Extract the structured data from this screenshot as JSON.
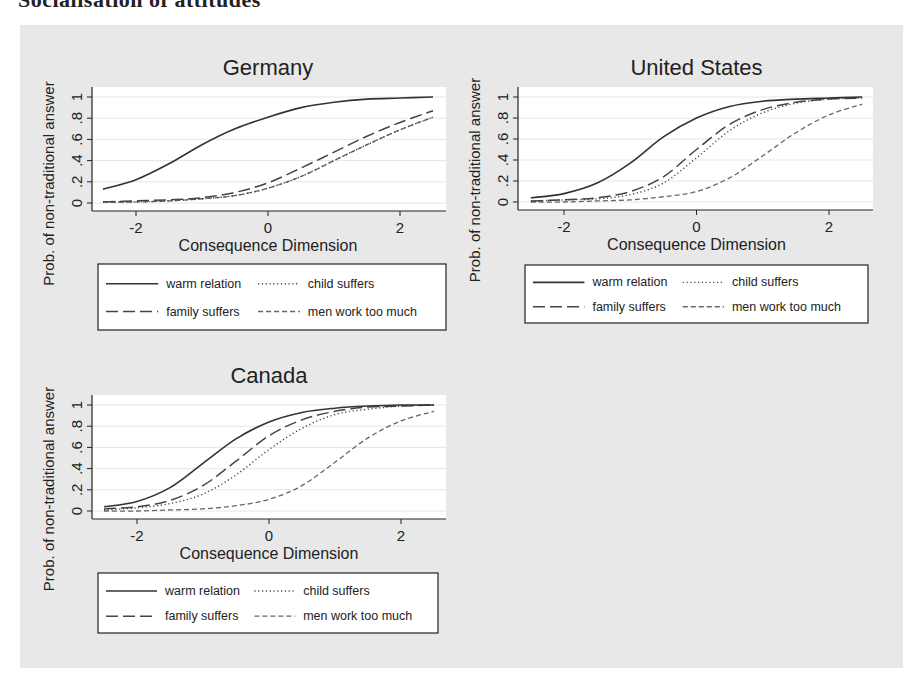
{
  "page": {
    "cut_heading": "Socialisation of attitudes",
    "background_color": "#e8e8e8"
  },
  "chart_data": [
    {
      "type": "line",
      "title": "Germany",
      "xlabel": "Consequence Dimension",
      "ylabel": "Prob. of non-traditional answer",
      "xlim": [
        -2.5,
        2.5
      ],
      "ylim": [
        0,
        1
      ],
      "xticks": [
        -2,
        0,
        2
      ],
      "yticks": [
        0,
        0.2,
        0.4,
        0.6,
        0.8,
        1
      ],
      "ytick_labels": [
        "0",
        ".2",
        ".4",
        ".6",
        ".8",
        "1"
      ],
      "grid": true,
      "legend_position": "bottom",
      "x": [
        -2.5,
        -2,
        -1.5,
        -1,
        -0.5,
        0,
        0.5,
        1,
        1.5,
        2,
        2.5
      ],
      "series": [
        {
          "name": "warm relation",
          "style": "solid",
          "values": [
            0.13,
            0.22,
            0.37,
            0.55,
            0.7,
            0.81,
            0.9,
            0.95,
            0.98,
            0.99,
            1.0
          ]
        },
        {
          "name": "child suffers",
          "style": "dotted",
          "values": [
            0.01,
            0.01,
            0.02,
            0.04,
            0.07,
            0.14,
            0.25,
            0.4,
            0.55,
            0.69,
            0.81
          ]
        },
        {
          "name": "family suffers",
          "style": "longdash",
          "values": [
            0.01,
            0.02,
            0.03,
            0.05,
            0.1,
            0.19,
            0.33,
            0.48,
            0.63,
            0.76,
            0.87
          ]
        },
        {
          "name": "men work too much",
          "style": "shortdash",
          "values": [
            0.01,
            0.01,
            0.02,
            0.04,
            0.07,
            0.14,
            0.25,
            0.4,
            0.55,
            0.69,
            0.81
          ]
        }
      ]
    },
    {
      "type": "line",
      "title": "United States",
      "xlabel": "Consequence Dimension",
      "ylabel": "Prob. of non-traditional answer",
      "xlim": [
        -2.5,
        2.5
      ],
      "ylim": [
        0,
        1
      ],
      "xticks": [
        -2,
        0,
        2
      ],
      "yticks": [
        0,
        0.2,
        0.4,
        0.6,
        0.8,
        1
      ],
      "ytick_labels": [
        "0",
        ".2",
        ".4",
        ".6",
        ".8",
        "1"
      ],
      "grid": true,
      "legend_position": "bottom",
      "x": [
        -2.5,
        -2,
        -1.5,
        -1,
        -0.5,
        0,
        0.5,
        1,
        1.5,
        2,
        2.5
      ],
      "series": [
        {
          "name": "warm relation",
          "style": "solid",
          "values": [
            0.04,
            0.08,
            0.18,
            0.37,
            0.62,
            0.8,
            0.91,
            0.96,
            0.98,
            0.99,
            1.0
          ]
        },
        {
          "name": "child suffers",
          "style": "dotted",
          "values": [
            0.01,
            0.02,
            0.03,
            0.07,
            0.18,
            0.42,
            0.68,
            0.85,
            0.94,
            0.98,
            0.99
          ]
        },
        {
          "name": "family suffers",
          "style": "longdash",
          "values": [
            0.01,
            0.02,
            0.04,
            0.1,
            0.24,
            0.5,
            0.74,
            0.88,
            0.95,
            0.98,
            0.99
          ]
        },
        {
          "name": "men work too much",
          "style": "shortdash",
          "values": [
            0.0,
            0.0,
            0.01,
            0.02,
            0.05,
            0.1,
            0.23,
            0.44,
            0.66,
            0.83,
            0.93
          ]
        }
      ]
    },
    {
      "type": "line",
      "title": "Canada",
      "xlabel": "Consequence Dimension",
      "ylabel": "Prob. of non-traditional answer",
      "xlim": [
        -2.5,
        2.5
      ],
      "ylim": [
        0,
        1
      ],
      "xticks": [
        -2,
        0,
        2
      ],
      "yticks": [
        0,
        0.2,
        0.4,
        0.6,
        0.8,
        1
      ],
      "ytick_labels": [
        "0",
        ".2",
        ".4",
        ".6",
        ".8",
        "1"
      ],
      "grid": true,
      "legend_position": "bottom",
      "x": [
        -2.5,
        -2,
        -1.5,
        -1,
        -0.5,
        0,
        0.5,
        1,
        1.5,
        2,
        2.5
      ],
      "series": [
        {
          "name": "warm relation",
          "style": "solid",
          "values": [
            0.04,
            0.09,
            0.22,
            0.45,
            0.68,
            0.84,
            0.93,
            0.97,
            0.99,
            1.0,
            1.0
          ]
        },
        {
          "name": "child suffers",
          "style": "dotted",
          "values": [
            0.01,
            0.03,
            0.07,
            0.16,
            0.34,
            0.58,
            0.78,
            0.91,
            0.96,
            0.99,
            1.0
          ]
        },
        {
          "name": "family suffers",
          "style": "longdash",
          "values": [
            0.02,
            0.04,
            0.1,
            0.24,
            0.47,
            0.71,
            0.86,
            0.94,
            0.98,
            0.99,
            1.0
          ]
        },
        {
          "name": "men work too much",
          "style": "shortdash",
          "values": [
            0.0,
            0.0,
            0.01,
            0.02,
            0.05,
            0.11,
            0.24,
            0.46,
            0.69,
            0.85,
            0.94
          ]
        }
      ]
    }
  ],
  "panels_layout": [
    {
      "left": 0,
      "top": 0,
      "plot": {
        "x0": 92,
        "x1": 446,
        "y1": 97,
        "y0": 203,
        "xmin_px": 136,
        "xmax_px": 400
      },
      "legend": {
        "x": 98,
        "y": 264,
        "w": 348,
        "h": 66
      }
    },
    {
      "left": 0,
      "top": 0,
      "plot": {
        "x0": 518,
        "x1": 873,
        "y1": 97,
        "y0": 202,
        "xmin_px": 564,
        "xmax_px": 829
      },
      "legend": {
        "x": 525,
        "y": 265,
        "w": 343,
        "h": 58
      }
    },
    {
      "left": 0,
      "top": 0,
      "plot": {
        "x0": 92,
        "x1": 446,
        "y1": 405,
        "y0": 511,
        "xmin_px": 137,
        "xmax_px": 401
      },
      "legend": {
        "x": 98,
        "y": 573,
        "w": 340,
        "h": 60
      }
    }
  ]
}
